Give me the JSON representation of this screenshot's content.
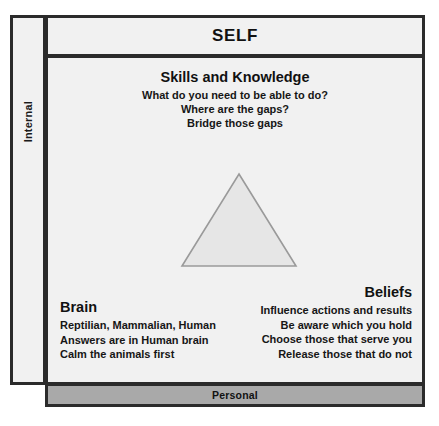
{
  "diagram": {
    "title": "SELF",
    "axis_label_vertical": "Internal",
    "footer_label": "Personal",
    "colors": {
      "panel_background": "#f1f1f1",
      "border": "#2b2b2b",
      "footer_bar": "#a9a9a9",
      "triangle_fill": "#e6e6e6",
      "triangle_stroke": "#9a9a9a",
      "text": "#111111"
    },
    "quadrants": {
      "skills": {
        "title": "Skills and Knowledge",
        "lines": [
          "What do you need to be able to do?",
          "Where are the gaps?",
          "Bridge those gaps"
        ]
      },
      "brain": {
        "title": "Brain",
        "lines": [
          "Reptilian, Mammalian, Human",
          "Answers are in Human brain",
          "Calm the animals first"
        ]
      },
      "beliefs": {
        "title": "Beliefs",
        "lines": [
          "Influence actions and results",
          "Be aware which you hold",
          "Choose those that serve you",
          "Release those that do not"
        ]
      }
    },
    "center_shape": {
      "name": "triangle",
      "fill": "#e6e6e6",
      "stroke": "#9a9a9a"
    }
  }
}
